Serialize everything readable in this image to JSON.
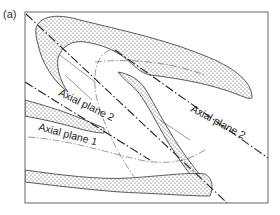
{
  "figure": {
    "panel_label": "(a)",
    "labels": {
      "axial_plane_2_left": "Axial plane 2",
      "axial_plane_1": "Axial plane 1",
      "axial_plane_2_right": "Axial plane 2"
    },
    "colors": {
      "line": "#222222",
      "frame": "#666666",
      "stipple": "#444444",
      "background": "#ffffff"
    }
  }
}
